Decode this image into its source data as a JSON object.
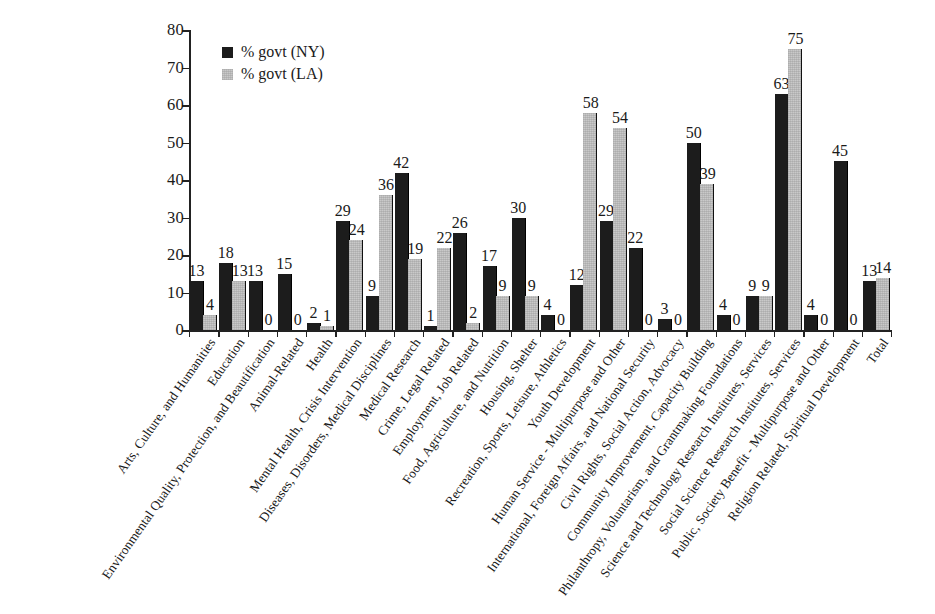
{
  "chart_data": {
    "type": "bar",
    "title": "",
    "subtitle": "",
    "xlabel": "",
    "ylabel": "",
    "ylim": [
      0,
      80
    ],
    "yticks": [
      0,
      10,
      20,
      30,
      40,
      50,
      60,
      70,
      80
    ],
    "grid": false,
    "legend_position": "top-left",
    "value_labels": true,
    "orientation": "vertical",
    "grouping": "grouped",
    "categories": [
      "Arts, Culture, and Humanities",
      "Education",
      "Environmental Quality, Protection, and Beautification",
      "Animal-Related",
      "Health",
      "Mental Health, Crisis Intervention",
      "Diseases, Disorders, Medical Disciplines",
      "Medical Research",
      "Crime, Legal Related",
      "Employment, Job Related",
      "Food, Agriculture, and Nutrition",
      "Housing, Shelter",
      "Recreation, Sports, Leisure, Athletics",
      "Youth Development",
      "Human Service - Multipurpose and Other",
      "International, Foreign Affairs, and National Security",
      "Civil Rights, Social Action, Advocacy",
      "Community Improvement, Capacity Building",
      "Philanthropy, Voluntarism, and Grantmaking Foundations",
      "Science and Technology Research Institutes, Services",
      "Social Science Research Institutes, Services",
      "Public, Society Benefit - Multipurpose and Other",
      "Religion Related, Spiritual Development",
      "Total"
    ],
    "series": [
      {
        "name": "% govt (NY)",
        "color": "#1c1c1c",
        "values": [
          13,
          18,
          13,
          15,
          2,
          29,
          9,
          42,
          1,
          26,
          17,
          30,
          4,
          12,
          29,
          22,
          3,
          50,
          4,
          9,
          63,
          4,
          45,
          13
        ]
      },
      {
        "name": "% govt (LA)",
        "color": "#c9c9c9",
        "values": [
          4,
          13,
          0,
          0,
          1,
          24,
          36,
          19,
          22,
          2,
          9,
          9,
          0,
          58,
          54,
          0,
          0,
          39,
          0,
          9,
          75,
          0,
          0,
          14
        ]
      }
    ]
  },
  "legend": {
    "items": [
      {
        "label": "% govt (NY)",
        "swatch": "ny"
      },
      {
        "label": "% govt (LA)",
        "swatch": "la"
      }
    ]
  },
  "colors": {
    "series_ny": "#1c1c1c",
    "series_la": "#c9c9c9",
    "axis": "#222222",
    "text": "#1a1a1a",
    "background": "#ffffff"
  }
}
